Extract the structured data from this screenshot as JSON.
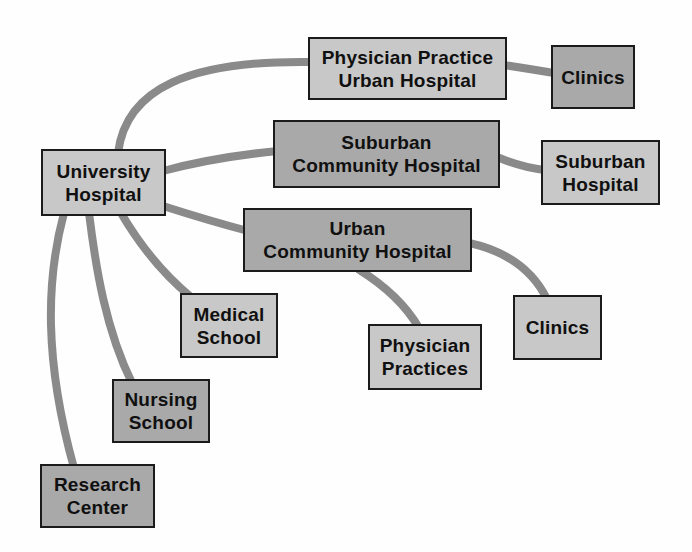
{
  "diagram": {
    "type": "network-diagram",
    "description_colors": {
      "node_fill_light": "#c8c8c8",
      "node_fill_medium": "#a9a9a9",
      "node_border": "#1b1b1b",
      "connector": "#8a8a8a",
      "background": "#fefefe"
    },
    "nodes": {
      "university_hospital": {
        "lines": [
          "University",
          "Hospital"
        ],
        "shade": "light"
      },
      "physician_practice_urban_hospital": {
        "lines": [
          "Physician Practice",
          "Urban Hospital"
        ],
        "shade": "light"
      },
      "clinics_top": {
        "lines": [
          "Clinics"
        ],
        "shade": "medium"
      },
      "suburban_community_hospital": {
        "lines": [
          "Suburban",
          "Community Hospital"
        ],
        "shade": "medium"
      },
      "suburban_hospital": {
        "lines": [
          "Suburban",
          "Hospital"
        ],
        "shade": "light"
      },
      "urban_community_hospital": {
        "lines": [
          "Urban",
          "Community Hospital"
        ],
        "shade": "medium"
      },
      "medical_school": {
        "lines": [
          "Medical",
          "School"
        ],
        "shade": "light"
      },
      "nursing_school": {
        "lines": [
          "Nursing",
          "School"
        ],
        "shade": "medium"
      },
      "physician_practices": {
        "lines": [
          "Physician",
          "Practices"
        ],
        "shade": "light"
      },
      "clinics_bottom": {
        "lines": [
          "Clinics"
        ],
        "shade": "light"
      },
      "research_center": {
        "lines": [
          "Research",
          "Center"
        ],
        "shade": "medium"
      }
    },
    "edges": [
      {
        "from": "university_hospital",
        "to": "physician_practice_urban_hospital"
      },
      {
        "from": "university_hospital",
        "to": "suburban_community_hospital"
      },
      {
        "from": "university_hospital",
        "to": "urban_community_hospital"
      },
      {
        "from": "university_hospital",
        "to": "medical_school"
      },
      {
        "from": "university_hospital",
        "to": "nursing_school"
      },
      {
        "from": "university_hospital",
        "to": "research_center"
      },
      {
        "from": "physician_practice_urban_hospital",
        "to": "clinics_top"
      },
      {
        "from": "suburban_community_hospital",
        "to": "suburban_hospital"
      },
      {
        "from": "urban_community_hospital",
        "to": "physician_practices"
      },
      {
        "from": "urban_community_hospital",
        "to": "clinics_bottom"
      }
    ]
  }
}
